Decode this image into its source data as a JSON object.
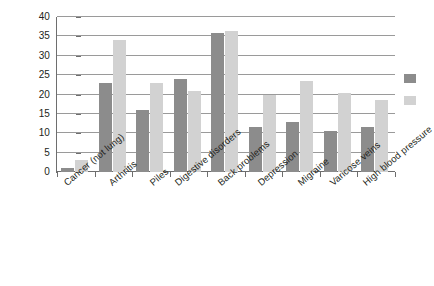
{
  "chart_data": {
    "type": "bar",
    "title": "",
    "subtitle": "",
    "xlabel": "",
    "ylabel": "",
    "ylim": [
      0,
      40
    ],
    "yticks": [
      0,
      5,
      10,
      15,
      20,
      25,
      30,
      35,
      40
    ],
    "grid": true,
    "legend_position": "right (cut off)",
    "categories": [
      "Cancer (not lung)",
      "Arthritis",
      "Piles",
      "Digestive disorders",
      "Back problems",
      "Depression",
      "Migraine",
      "Varicose veins",
      "High blood pressure"
    ],
    "series": [
      {
        "name": "Series 1",
        "color": "#8c8c8c",
        "values": [
          1,
          23,
          16,
          24,
          36,
          11.5,
          13,
          10.5,
          11.5
        ]
      },
      {
        "name": "Series 2",
        "color": "#d2d2d2",
        "values": [
          3,
          34,
          23,
          21,
          36.5,
          20,
          23.5,
          20.5,
          18.5
        ]
      }
    ]
  },
  "axis": {
    "y_tick_labels": [
      "0",
      "5",
      "10",
      "15",
      "20",
      "25",
      "30",
      "35",
      "40"
    ]
  },
  "colors": {
    "series1": "#8c8c8c",
    "series2": "#d2d2d2",
    "axis": "#6e6e6e",
    "grid": "#9a9a9a",
    "text": "#231f20",
    "background": "#ffffff"
  }
}
